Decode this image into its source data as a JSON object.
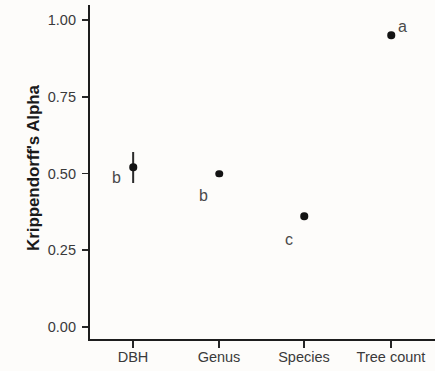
{
  "chart_data": {
    "type": "scatter",
    "title": "",
    "subtitle": "",
    "xlabel": "",
    "ylabel": "Krippendorff's Alpha",
    "categories": [
      "DBH",
      "Genus",
      "Species",
      "Tree count"
    ],
    "values": [
      0.52,
      0.5,
      0.36,
      0.95
    ],
    "error_low": [
      0.47,
      0.5,
      0.36,
      0.95
    ],
    "error_high": [
      0.57,
      0.5,
      0.36,
      0.95
    ],
    "point_labels": [
      "b",
      "b",
      "c",
      "a"
    ],
    "ylim": [
      0.0,
      1.0
    ],
    "y_ticks": [
      "0.00",
      "0.25",
      "0.50",
      "0.75",
      "1.00"
    ],
    "y_tick_values": [
      0.0,
      0.25,
      0.5,
      0.75,
      1.0
    ],
    "grid": false,
    "legend": "none",
    "point_color": "#131313",
    "axis_color": "#1d1d1d",
    "background_color": "#fdfcfa"
  }
}
